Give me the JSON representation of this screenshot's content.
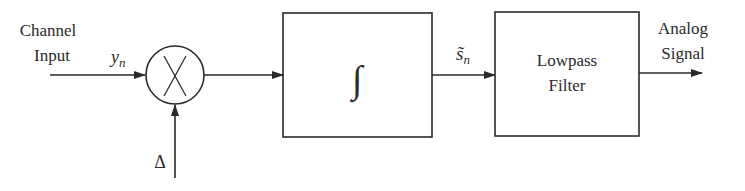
{
  "diagram": {
    "type": "block-diagram",
    "input_label_line1": "Channel",
    "input_label_line2": "Input",
    "input_signal": "y",
    "input_signal_sub": "n",
    "multiplier_symbol": "×",
    "step_label": "Δ",
    "integrator_symbol": "∫",
    "intermediate_signal": "s̃",
    "intermediate_signal_sub": "n",
    "filter_label_line1": "Lowpass",
    "filter_label_line2": "Filter",
    "output_label_line1": "Analog",
    "output_label_line2": "Signal",
    "colors": {
      "stroke": "#2a2a2a",
      "background": "#ffffff"
    }
  }
}
